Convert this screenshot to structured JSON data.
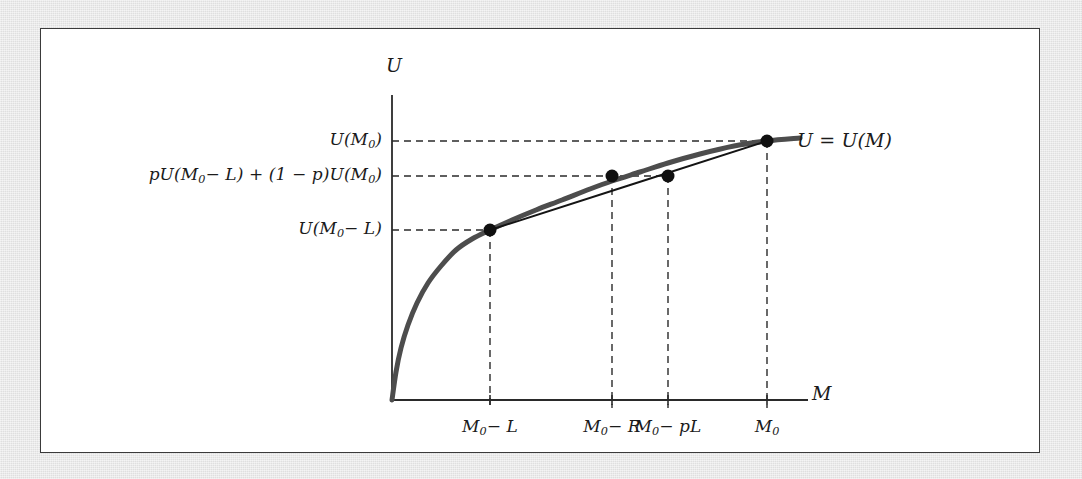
{
  "figure": {
    "title_text": "",
    "frame_color": "#3a3a3a",
    "plate_color": "#e8e8e8",
    "panel_color": "#ffffff"
  },
  "axes": {
    "y_axis_name": "U",
    "x_axis_name": "M",
    "curve_label": "U = U(M)"
  },
  "y_ticks": [
    {
      "id": "u-m0",
      "label_html": "U(M<sub>0</sub>)",
      "value": 1.0,
      "y_px": 141
    },
    {
      "id": "expected-u",
      "label_html": "pU(M<sub>0</sub>− L) + (1 − p)U(M<sub>0</sub>)",
      "value": 0.885,
      "y_px": 176
    },
    {
      "id": "u-m0-minus-l",
      "label_html": "U(M<sub>0</sub>− L)",
      "value": 0.655,
      "y_px": 230
    }
  ],
  "x_ticks": [
    {
      "id": "m0-minus-l",
      "label_html": "M<sub>0</sub>− L",
      "x_px": 490
    },
    {
      "id": "m0-minus-r",
      "label_html": "M<sub>0</sub>− R",
      "x_px": 612
    },
    {
      "id": "m0-minus-pl",
      "label_html": "M<sub>0</sub>− pL",
      "x_px": 668
    },
    {
      "id": "m0",
      "label_html": "M<sub>0</sub>",
      "x_px": 767
    }
  ],
  "chart_data": {
    "type": "line",
    "xlabel": "M",
    "ylabel": "U",
    "grid": "dashed-guides-only",
    "legend": "none",
    "axis_origin_px": {
      "x": 392,
      "y": 400
    },
    "axis_end_px": {
      "x": 800,
      "y": 95
    },
    "series": [
      {
        "name": "U = U(M)",
        "role": "utility-curve",
        "style": "thick-gray-concave",
        "color": "#4d4d4d",
        "width_px": 5,
        "points_px": [
          [
            392,
            400
          ],
          [
            396,
            372
          ],
          [
            401,
            348
          ],
          [
            408,
            325
          ],
          [
            417,
            303
          ],
          [
            428,
            283
          ],
          [
            441,
            266
          ],
          [
            456,
            250
          ],
          [
            472,
            239
          ],
          [
            490,
            230
          ],
          [
            512,
            220
          ],
          [
            536,
            210
          ],
          [
            562,
            200
          ],
          [
            590,
            189
          ],
          [
            612,
            181
          ],
          [
            640,
            172
          ],
          [
            668,
            163
          ],
          [
            700,
            154
          ],
          [
            734,
            146
          ],
          [
            767,
            141
          ],
          [
            800,
            138
          ]
        ]
      },
      {
        "name": "chord",
        "role": "expected-utility-chord",
        "style": "thin-black-straight",
        "color": "#141414",
        "width_px": 2,
        "points_px": [
          [
            490,
            230
          ],
          [
            767,
            141
          ]
        ]
      }
    ],
    "markers": [
      {
        "id": "pt-m0-minus-l",
        "x_px": 490,
        "y_px": 230,
        "on": "curve",
        "label": "U(M0 − L)"
      },
      {
        "id": "pt-m0-minus-r",
        "x_px": 612,
        "y_px": 176,
        "on": "curve",
        "label": "certainty equivalent"
      },
      {
        "id": "pt-m0-minus-pl",
        "x_px": 668,
        "y_px": 176,
        "on": "chord",
        "label": "expected utility of gamble"
      },
      {
        "id": "pt-m0",
        "x_px": 767,
        "y_px": 141,
        "on": "curve",
        "label": "U(M0)"
      }
    ],
    "guides": [
      {
        "from_px": [
          392,
          141
        ],
        "to_px": [
          767,
          141
        ],
        "orientation": "horizontal"
      },
      {
        "from_px": [
          392,
          176
        ],
        "to_px": [
          668,
          176
        ],
        "orientation": "horizontal"
      },
      {
        "from_px": [
          392,
          230
        ],
        "to_px": [
          490,
          230
        ],
        "orientation": "horizontal"
      },
      {
        "from_px": [
          490,
          230
        ],
        "to_px": [
          490,
          408
        ],
        "orientation": "vertical"
      },
      {
        "from_px": [
          612,
          176
        ],
        "to_px": [
          612,
          408
        ],
        "orientation": "vertical"
      },
      {
        "from_px": [
          668,
          176
        ],
        "to_px": [
          668,
          408
        ],
        "orientation": "vertical"
      },
      {
        "from_px": [
          767,
          141
        ],
        "to_px": [
          767,
          408
        ],
        "orientation": "vertical"
      }
    ]
  }
}
